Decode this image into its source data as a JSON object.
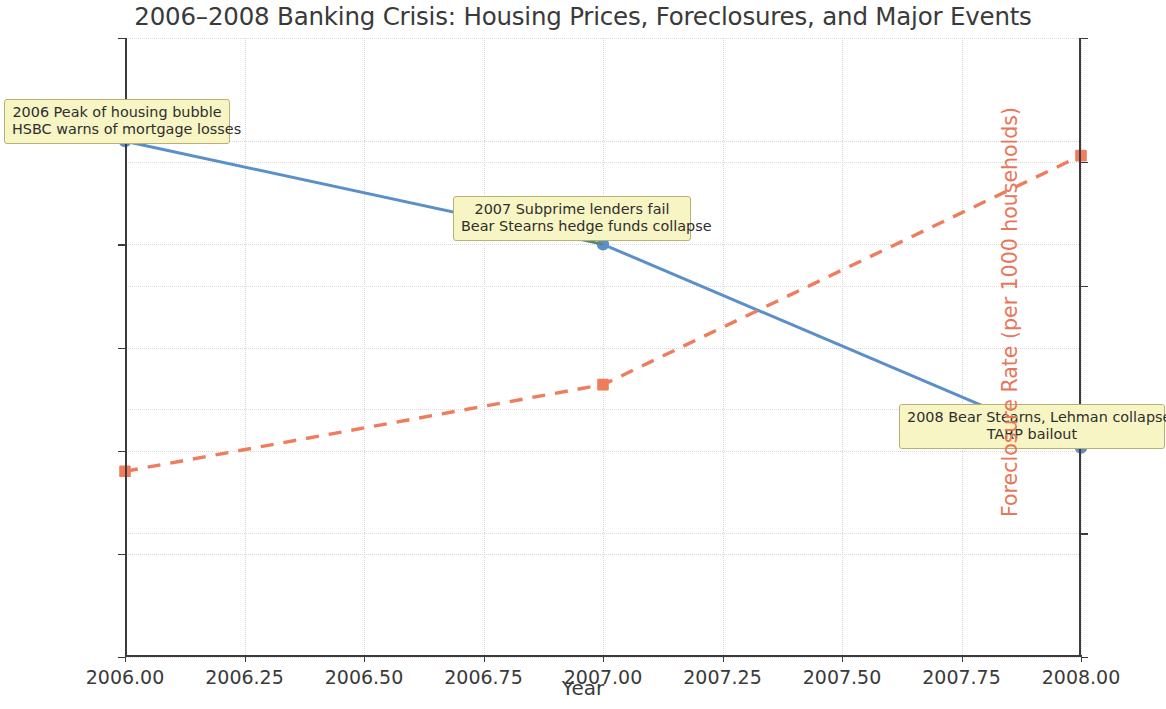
{
  "chart_data": {
    "type": "line",
    "title": "2006–2008 Banking Crisis: Housing Prices, Foreclosures, and Major Events",
    "xlabel": "Year",
    "x": [
      2006,
      2007,
      2008
    ],
    "xlim": [
      2006.0,
      2008.0
    ],
    "xticks": [
      "2006.00",
      "2006.25",
      "2006.50",
      "2006.75",
      "2007.00",
      "2007.25",
      "2007.50",
      "2007.75",
      "2008.00"
    ],
    "xtick_values": [
      2006.0,
      2006.25,
      2006.5,
      2006.75,
      2007.0,
      2007.25,
      2007.5,
      2007.75,
      2008.0
    ],
    "grid": true,
    "legend": "none",
    "axes": [
      {
        "id": "left",
        "ylabel": "Housing Price Index (2006=200)",
        "ylim": [
          150,
          210
        ],
        "yticks": [
          "150",
          "160",
          "170",
          "180",
          "190",
          "200",
          "210"
        ],
        "ytick_values": [
          150,
          160,
          170,
          180,
          190,
          200,
          210
        ],
        "color": "#6f9fd0"
      },
      {
        "id": "right",
        "ylabel": "Foreclosure Rate (per 1000 households)",
        "ylim": [
          0,
          5
        ],
        "yticks": [
          "0",
          "1",
          "2",
          "3",
          "4",
          "5"
        ],
        "ytick_values": [
          0,
          1,
          2,
          3,
          4,
          5
        ],
        "color": "#e8775a"
      }
    ],
    "series": [
      {
        "name": "Housing Price Index (2006=200)",
        "axis": "left",
        "values": [
          200,
          190,
          170.3
        ],
        "color": "#5b8fc9",
        "linestyle": "solid",
        "marker": "circle"
      },
      {
        "name": "Foreclosure Rate (per 1000 households)",
        "axis": "right",
        "values": [
          1.5,
          2.2,
          4.05
        ],
        "color": "#ef7c5c",
        "linestyle": "dashed",
        "marker": "square"
      }
    ],
    "annotations": [
      {
        "id": "annotation-2006",
        "lines": [
          "2006 Peak of housing bubble",
          "HSBC warns of mortgage losses"
        ],
        "target_x": 2006,
        "target_y_left": 200,
        "box_facecolor": "#f7f5c4",
        "box_edgecolor": "#b9b173",
        "arrow_color": "#5a8a4a"
      },
      {
        "id": "annotation-2007",
        "lines": [
          "2007 Subprime lenders fail",
          "Bear Stearns hedge funds collapse"
        ],
        "target_x": 2007,
        "target_y_left": 190,
        "box_facecolor": "#f7f5c4",
        "box_edgecolor": "#b9b173",
        "arrow_color": "#5a8a4a"
      },
      {
        "id": "annotation-2008",
        "lines": [
          "2008 Bear Stearns, Lehman collapse",
          "TARP bailout"
        ],
        "target_x": 2008,
        "target_y_left": 170.3,
        "box_facecolor": "#f7f5c4",
        "box_edgecolor": "#b9b173",
        "arrow_color": "#5a8a4a"
      }
    ]
  }
}
